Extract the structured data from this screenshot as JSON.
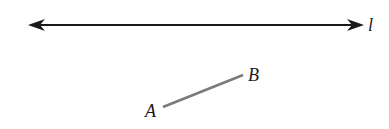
{
  "diagram": {
    "line": {
      "label": "l",
      "x1": 28,
      "y1": 25,
      "x2": 362,
      "y2": 25,
      "color": "#1a1a1a"
    },
    "segment": {
      "start": {
        "label": "A",
        "x": 163,
        "y": 107
      },
      "end": {
        "label": "B",
        "x": 243,
        "y": 75
      },
      "color": "#7a7a7a"
    }
  }
}
